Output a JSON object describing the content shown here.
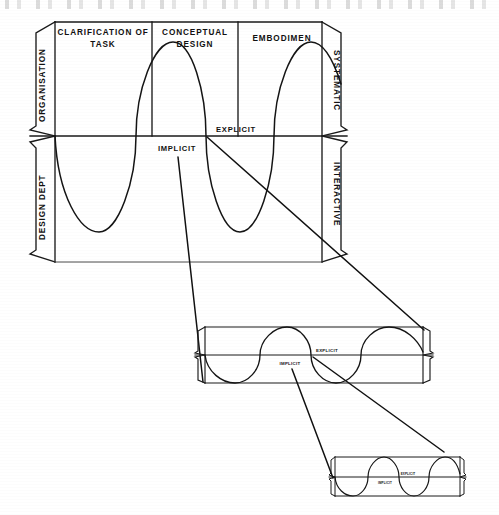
{
  "figure": {
    "background_color": "#ffffff",
    "ink_color": "#1a1a1a"
  },
  "main_net": {
    "columns": [
      {
        "id": "clarification",
        "line1": "CLARIFICATION OF",
        "line2": "TASK"
      },
      {
        "id": "conceptual",
        "line1": "CONCEPTUAL",
        "line2": "DESIGN"
      },
      {
        "id": "embodiment",
        "line1": "EMBODIMEN",
        "line2": ""
      }
    ],
    "side_labels": {
      "top_left": "ORGANISATION",
      "bottom_left": "DESIGN DEPT",
      "top_right": "SYSTEMATIC",
      "bottom_right": "INTERACTIVE"
    },
    "wave_labels": {
      "above_line": "EXPLICIT",
      "below_line": "IMPLICIT"
    }
  },
  "medium_net": {
    "wave_labels": {
      "above_line": "EXPLICIT",
      "below_line": "IMPLICIT"
    }
  },
  "small_net": {
    "wave_labels": {
      "above_line": "EXPLICIT",
      "below_line": "IMPLICIT"
    }
  }
}
